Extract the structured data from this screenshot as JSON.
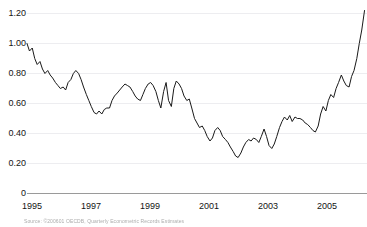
{
  "chart_data": {
    "type": "line",
    "title": "",
    "subtitle": "",
    "xlabel": "",
    "ylabel": "",
    "legend": [],
    "legend_position": "none",
    "grid": true,
    "grid_axis": "y",
    "xlim": [
      1995.0,
      2006.0
    ],
    "ylim": [
      0,
      1.25
    ],
    "y_ticks": [
      0,
      0.2,
      0.4,
      0.6,
      0.8,
      1.0,
      1.2
    ],
    "y_tick_labels": [
      "0",
      "0.20",
      "0.40",
      "0.60",
      "0.80",
      "1.00",
      "1.20"
    ],
    "x_ticks": [
      1995,
      1997,
      1999,
      2001,
      2003,
      2005
    ],
    "x_tick_labels": [
      "1995",
      "1997",
      "1999",
      "2001",
      "2003",
      "2005"
    ],
    "line_color": "#1a1a1a",
    "grid_color": "#ededf0",
    "axis_color": "#9a9a9a",
    "background": "#ffffff",
    "series": [
      {
        "name": "series-1",
        "x": [
          1995.0,
          1995.08,
          1995.17,
          1995.25,
          1995.33,
          1995.42,
          1995.5,
          1995.58,
          1995.67,
          1995.75,
          1995.83,
          1995.92,
          1996.0,
          1996.08,
          1996.17,
          1996.25,
          1996.33,
          1996.42,
          1996.5,
          1996.58,
          1996.67,
          1996.75,
          1996.83,
          1996.92,
          1997.0,
          1997.08,
          1997.17,
          1997.25,
          1997.33,
          1997.42,
          1997.5,
          1997.58,
          1997.67,
          1997.75,
          1997.83,
          1997.92,
          1998.0,
          1998.08,
          1998.17,
          1998.25,
          1998.33,
          1998.42,
          1998.5,
          1998.58,
          1998.67,
          1998.75,
          1998.83,
          1998.92,
          1999.0,
          1999.08,
          1999.17,
          1999.25,
          1999.33,
          1999.42,
          1999.5,
          1999.58,
          1999.67,
          1999.75,
          1999.83,
          1999.92,
          2000.0,
          2000.08,
          2000.17,
          2000.25,
          2000.33,
          2000.42,
          2000.5,
          2000.58,
          2000.67,
          2000.75,
          2000.83,
          2000.92,
          2001.0,
          2001.08,
          2001.17,
          2001.25,
          2001.33,
          2001.42,
          2001.5,
          2001.58,
          2001.67,
          2001.75,
          2001.83,
          2001.92,
          2002.0,
          2002.08,
          2002.17,
          2002.25,
          2002.33,
          2002.42,
          2002.5,
          2002.58,
          2002.67,
          2002.75,
          2002.83,
          2002.92,
          2003.0,
          2003.08,
          2003.17,
          2003.25,
          2003.33,
          2003.42,
          2003.5,
          2003.58,
          2003.67,
          2003.75,
          2003.83,
          2003.92,
          2004.0,
          2004.08,
          2004.17,
          2004.25,
          2004.33,
          2004.42,
          2004.5,
          2004.58,
          2004.67,
          2004.75,
          2004.83,
          2004.92,
          2005.0,
          2005.08,
          2005.17,
          2005.25,
          2005.33,
          2005.42,
          2005.5,
          2005.58,
          2005.67,
          2005.75,
          2005.83,
          2005.92
        ],
        "values": [
          1.0,
          0.95,
          0.97,
          0.9,
          0.86,
          0.88,
          0.83,
          0.8,
          0.82,
          0.79,
          0.77,
          0.74,
          0.72,
          0.7,
          0.71,
          0.69,
          0.74,
          0.76,
          0.8,
          0.82,
          0.8,
          0.76,
          0.71,
          0.66,
          0.62,
          0.58,
          0.54,
          0.53,
          0.55,
          0.53,
          0.56,
          0.57,
          0.57,
          0.62,
          0.65,
          0.67,
          0.69,
          0.71,
          0.73,
          0.72,
          0.71,
          0.68,
          0.65,
          0.63,
          0.62,
          0.66,
          0.7,
          0.73,
          0.74,
          0.72,
          0.68,
          0.62,
          0.57,
          0.68,
          0.74,
          0.62,
          0.58,
          0.7,
          0.75,
          0.73,
          0.7,
          0.65,
          0.62,
          0.63,
          0.57,
          0.5,
          0.47,
          0.44,
          0.45,
          0.42,
          0.38,
          0.35,
          0.37,
          0.42,
          0.44,
          0.42,
          0.38,
          0.36,
          0.34,
          0.31,
          0.28,
          0.25,
          0.24,
          0.27,
          0.31,
          0.34,
          0.36,
          0.35,
          0.37,
          0.36,
          0.34,
          0.38,
          0.43,
          0.38,
          0.32,
          0.3,
          0.33,
          0.38,
          0.44,
          0.48,
          0.51,
          0.49,
          0.52,
          0.48,
          0.51,
          0.5,
          0.5,
          0.49,
          0.47,
          0.46,
          0.44,
          0.42,
          0.41,
          0.45,
          0.53,
          0.58,
          0.55,
          0.62,
          0.66,
          0.64,
          0.7,
          0.74,
          0.79,
          0.75,
          0.72,
          0.71,
          0.78,
          0.82,
          0.9,
          1.0,
          1.09,
          1.22
        ]
      }
    ],
    "annotations": [],
    "notable_points": {
      "start_value": 1.0,
      "start_year": 1995,
      "min_value": 0.24,
      "min_year": 2001.83,
      "max_value": 1.22,
      "max_year": 2005.92,
      "end_value": 1.21
    }
  },
  "footer": {
    "source_note": "Source: ©200601 OECDB, Quarterly Econometric Records Estimates"
  }
}
